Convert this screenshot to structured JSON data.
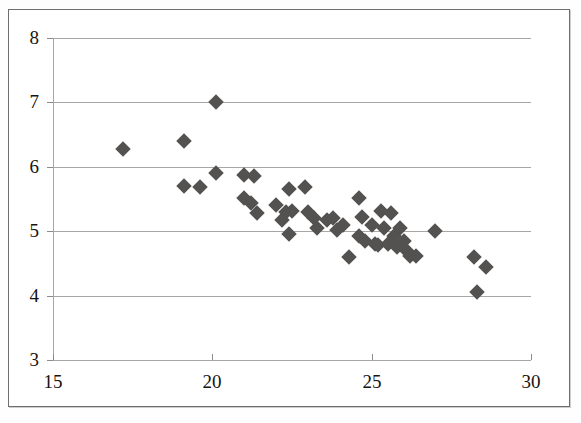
{
  "chart": {
    "type": "scatter",
    "title": "",
    "xlabel": "",
    "ylabel": "",
    "marker_color": "#545251",
    "marker_shape": "diamond",
    "grid": "horizontal",
    "legend": "none",
    "background": "#ffffff",
    "axis_color": "#a9a7a4"
  },
  "axes": {
    "x": {
      "min": 15,
      "max": 30,
      "ticks": [
        15,
        20,
        25,
        30
      ],
      "tick_labels": [
        "15",
        "20",
        "25",
        "30"
      ]
    },
    "y": {
      "min": 3,
      "max": 8,
      "ticks": [
        3,
        4,
        5,
        6,
        7,
        8
      ],
      "tick_labels": [
        "3",
        "4",
        "5",
        "6",
        "7",
        "8"
      ]
    }
  },
  "chart_data": {
    "type": "scatter",
    "title": "",
    "xlabel": "",
    "ylabel": "",
    "xlim": [
      15,
      30
    ],
    "ylim": [
      3,
      8
    ],
    "xticks": [
      15,
      20,
      25,
      30
    ],
    "yticks": [
      3,
      4,
      5,
      6,
      7,
      8
    ],
    "grid": "horizontal",
    "legend": "none",
    "series": [
      {
        "name": "observations",
        "marker": "diamond",
        "color": "#545251",
        "points": [
          [
            17.2,
            6.28
          ],
          [
            19.1,
            6.4
          ],
          [
            20.1,
            7.0
          ],
          [
            19.1,
            5.7
          ],
          [
            19.6,
            5.68
          ],
          [
            20.1,
            5.9
          ],
          [
            21.0,
            5.88
          ],
          [
            21.3,
            5.85
          ],
          [
            21.0,
            5.52
          ],
          [
            21.2,
            5.44
          ],
          [
            21.4,
            5.28
          ],
          [
            22.0,
            5.4
          ],
          [
            22.4,
            5.65
          ],
          [
            22.3,
            5.3
          ],
          [
            22.5,
            5.32
          ],
          [
            22.2,
            5.18
          ],
          [
            22.4,
            4.95
          ],
          [
            22.9,
            5.68
          ],
          [
            23.0,
            5.3
          ],
          [
            23.2,
            5.2
          ],
          [
            23.3,
            5.05
          ],
          [
            23.6,
            5.18
          ],
          [
            23.8,
            5.2
          ],
          [
            23.9,
            5.02
          ],
          [
            24.1,
            5.1
          ],
          [
            24.3,
            4.6
          ],
          [
            24.6,
            5.52
          ],
          [
            24.7,
            5.22
          ],
          [
            24.6,
            4.92
          ],
          [
            24.8,
            4.85
          ],
          [
            25.0,
            5.1
          ],
          [
            25.1,
            4.8
          ],
          [
            25.2,
            4.78
          ],
          [
            25.3,
            5.32
          ],
          [
            25.4,
            5.05
          ],
          [
            25.5,
            4.8
          ],
          [
            25.6,
            5.28
          ],
          [
            25.7,
            4.92
          ],
          [
            25.8,
            4.75
          ],
          [
            25.9,
            5.05
          ],
          [
            26.0,
            4.85
          ],
          [
            26.1,
            4.7
          ],
          [
            26.2,
            4.62
          ],
          [
            26.4,
            4.62
          ],
          [
            27.0,
            5.0
          ],
          [
            28.2,
            4.6
          ],
          [
            28.6,
            4.45
          ],
          [
            28.3,
            4.05
          ]
        ]
      }
    ]
  }
}
